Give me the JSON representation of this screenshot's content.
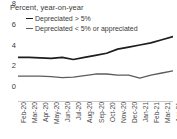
{
  "chart_data": {
    "type": "line",
    "title": "Percent, year-on-year",
    "xlabel": "",
    "ylabel": "",
    "ylim": [
      0,
      8
    ],
    "yticks": [
      0,
      2,
      4,
      6,
      8
    ],
    "grid": false,
    "legend_position": "top-left",
    "categories": [
      "Feb-20",
      "Mar-20",
      "Apr-20",
      "May-20",
      "Jun-20",
      "Jul-20",
      "Aug-20",
      "Sep-20",
      "Oct-20",
      "Nov-20",
      "Dec-20",
      "Jan-21",
      "Feb-21",
      "Mar-21",
      "Apr-21"
    ],
    "series": [
      {
        "name": "Depreciated > 5%",
        "color": "#1d1d1d",
        "values": [
          4.2,
          4.2,
          4.15,
          4.1,
          4.2,
          4.0,
          4.2,
          4.4,
          4.6,
          5.0,
          5.2,
          5.4,
          5.6,
          5.9,
          6.2
        ]
      },
      {
        "name": "Depreciated < 5% or appreciated",
        "color": "#5c5c5c",
        "values": [
          2.4,
          2.4,
          2.4,
          2.35,
          2.25,
          2.3,
          2.45,
          2.6,
          2.6,
          2.5,
          2.5,
          2.2,
          2.5,
          2.7,
          2.9
        ]
      }
    ]
  },
  "axis": {
    "y_labels": [
      "8",
      "6",
      "4",
      "2",
      "0"
    ]
  }
}
